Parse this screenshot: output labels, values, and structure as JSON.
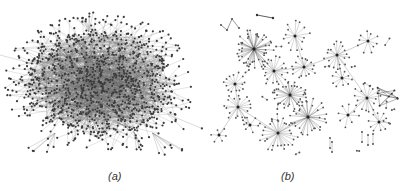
{
  "figure": {
    "panels": [
      {
        "id": "a",
        "caption": "(a)",
        "description": "dense hairball network with a large central cluster and peripheral leaf nodes",
        "style": {
          "node_color": "#3a3a3a",
          "edge_color": "#6a6a6a",
          "background": "#ffffff"
        },
        "layout": {
          "center_x": 100,
          "center_y": 82,
          "radius_x": 88,
          "radius_y": 62,
          "core_nodes": 900,
          "leaf_nodes": 260
        }
      },
      {
        "id": "b",
        "caption": "(b)",
        "description": "sparse tree-like network composed of many star hubs connected by long edges",
        "style": {
          "node_color": "#555555",
          "edge_color": "#8a8a8a",
          "hub_edge_color": "#222222",
          "background": "#ffffff"
        },
        "hubs": [
          {
            "x": 49,
            "y": 49,
            "leaves": 45,
            "r": 18,
            "dense": true
          },
          {
            "x": 69,
            "y": 71,
            "leaves": 20,
            "r": 14
          },
          {
            "x": 85,
            "y": 95,
            "leaves": 28,
            "r": 15,
            "dense": true
          },
          {
            "x": 103,
            "y": 117,
            "leaves": 30,
            "r": 18,
            "dense": true
          },
          {
            "x": 73,
            "y": 133,
            "leaves": 30,
            "r": 19
          },
          {
            "x": 33,
            "y": 107,
            "leaves": 18,
            "r": 13
          },
          {
            "x": 30,
            "y": 84,
            "leaves": 14,
            "r": 11
          },
          {
            "x": 99,
            "y": 67,
            "leaves": 16,
            "r": 12
          },
          {
            "x": 132,
            "y": 55,
            "leaves": 18,
            "r": 13
          },
          {
            "x": 163,
            "y": 41,
            "leaves": 10,
            "r": 12
          },
          {
            "x": 162,
            "y": 98,
            "leaves": 16,
            "r": 14
          },
          {
            "x": 174,
            "y": 122,
            "leaves": 10,
            "r": 12
          },
          {
            "x": 143,
            "y": 115,
            "leaves": 8,
            "r": 12
          },
          {
            "x": 90,
            "y": 36,
            "leaves": 14,
            "r": 14
          },
          {
            "x": 14,
            "y": 135,
            "leaves": 6,
            "r": 8
          },
          {
            "x": 137,
            "y": 78,
            "leaves": 10,
            "r": 10
          },
          {
            "x": 45,
            "y": 125,
            "leaves": 6,
            "r": 9
          }
        ],
        "arrow": {
          "x1": 52,
          "y1": 15,
          "x2": 68,
          "y2": 18
        },
        "cage": {
          "x": 171,
          "y": 82,
          "w": 22,
          "h": 30
        }
      }
    ]
  }
}
